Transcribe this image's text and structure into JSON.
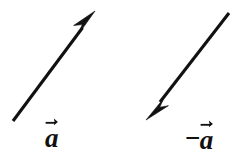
{
  "figure": {
    "background_color": "#ffffff",
    "stroke_color": "#111111",
    "width": 238,
    "height": 156
  },
  "vectors": [
    {
      "id": "vector-a",
      "name": "a",
      "label": "a",
      "label_prefix": "",
      "has_vector_accent": true,
      "direction": "up-right",
      "tail": {
        "x": 13,
        "y": 121
      },
      "tip": {
        "x": 95,
        "y": 11
      },
      "angle_degrees": 53.3,
      "length_px": 137,
      "shaft_width_px": 3,
      "arrowhead_length_px": 26,
      "arrowhead_half_width_px": 6.5
    },
    {
      "id": "vector-negative-a",
      "name": "-a",
      "label": "a",
      "label_prefix": "−",
      "has_vector_accent": true,
      "direction": "down-left",
      "tail": {
        "x": 229,
        "y": 13
      },
      "tip": {
        "x": 146,
        "y": 120
      },
      "angle_degrees": 232.2,
      "length_px": 135,
      "shaft_width_px": 3,
      "arrowhead_length_px": 26,
      "arrowhead_half_width_px": 6.5
    }
  ],
  "labels": {
    "left": {
      "text": "a",
      "prefix": "",
      "accent": "vector-arrow-right"
    },
    "right": {
      "text": "a",
      "prefix": "−",
      "accent": "vector-arrow-right"
    }
  }
}
